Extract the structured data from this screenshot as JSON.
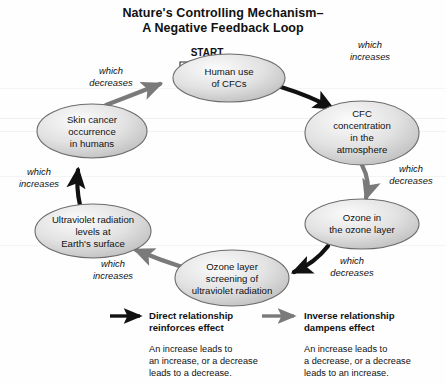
{
  "title": {
    "line1": "Nature's Controlling Mechanism–",
    "line2": "A Negative Feedback Loop"
  },
  "colors": {
    "direct_arrow": "#111111",
    "inverse_arrow": "#7a7a7a",
    "node_stroke": "#6b6b6b",
    "node_fill_light": "#f4f4f4",
    "node_fill_dark": "#c9c9c9",
    "text": "#111111"
  },
  "start_marker": {
    "label": "START",
    "icon": "hollow-right-arrow"
  },
  "nodes": [
    {
      "id": "human-use-of-cfcs",
      "lines": [
        "Human use",
        "of CFCs"
      ]
    },
    {
      "id": "cfc-concentration",
      "lines": [
        "CFC",
        "concentration",
        "in the",
        "atmosphere"
      ]
    },
    {
      "id": "ozone-in-layer",
      "lines": [
        "Ozone in",
        "the ozone layer"
      ]
    },
    {
      "id": "ozone-layer-screening",
      "lines": [
        "Ozone layer",
        "screening of",
        "ultraviolet radiation"
      ]
    },
    {
      "id": "uv-radiation-levels",
      "lines": [
        "Ultraviolet radiation",
        "levels at",
        "Earth's surface"
      ]
    },
    {
      "id": "skin-cancer-occurrence",
      "lines": [
        "Skin cancer",
        "occurrence",
        "in humans"
      ]
    }
  ],
  "edges": [
    {
      "id": "human-use-to-cfc-concentration",
      "from": "human-use-of-cfcs",
      "to": "cfc-concentration",
      "relationship": "direct",
      "lines": [
        "which",
        "increases"
      ]
    },
    {
      "id": "cfc-concentration-to-ozone",
      "from": "cfc-concentration",
      "to": "ozone-in-layer",
      "relationship": "inverse",
      "lines": [
        "which",
        "decreases"
      ]
    },
    {
      "id": "ozone-to-screening",
      "from": "ozone-in-layer",
      "to": "ozone-layer-screening",
      "relationship": "direct",
      "lines": [
        "which",
        "decreases"
      ]
    },
    {
      "id": "screening-to-uv-levels",
      "from": "ozone-layer-screening",
      "to": "uv-radiation-levels",
      "relationship": "inverse",
      "lines": [
        "which",
        "increases"
      ]
    },
    {
      "id": "uv-levels-to-skin-cancer",
      "from": "uv-radiation-levels",
      "to": "skin-cancer-occurrence",
      "relationship": "direct",
      "lines": [
        "which",
        "increases"
      ]
    },
    {
      "id": "skin-cancer-to-human-use",
      "from": "skin-cancer-occurrence",
      "to": "human-use-of-cfcs",
      "relationship": "inverse",
      "lines": [
        "which",
        "decreases"
      ]
    }
  ],
  "legend": [
    {
      "id": "direct-relationship",
      "arrow": "black-solid-arrow",
      "title_line1": "Direct relationship",
      "title_line2": "reinforces effect",
      "body_line1": "An increase leads to",
      "body_line2": "an increase, or a decrease",
      "body_line3": "leads to a decrease."
    },
    {
      "id": "inverse-relationship",
      "arrow": "gray-solid-arrow",
      "title_line1": "Inverse relationship",
      "title_line2": "dampens effect",
      "body_line1": "An increase leads to",
      "body_line2": "a decrease, or a decrease",
      "body_line3": "leads to an increase."
    }
  ]
}
